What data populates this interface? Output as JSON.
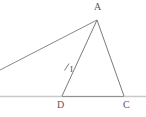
{
  "figure": {
    "background_color": "#ffffff",
    "stroke_color": "#6b6b6d",
    "baseline_color": "#c9c9c9",
    "label_color": "#59595b",
    "labels": {
      "apex": "A",
      "base_left": "D",
      "base_right": "C",
      "interior_point": "I"
    },
    "points": {
      "A": {
        "name": "A",
        "x": 97,
        "y": 20
      },
      "D": {
        "name": "D",
        "x": 62,
        "y": 96
      },
      "C": {
        "name": "C",
        "x": 124,
        "y": 96
      },
      "I": {
        "name": "I",
        "x": 68,
        "y": 67
      },
      "ray_end_left": {
        "name": "ray-end",
        "x": 0,
        "y": 70
      },
      "baseline_left": {
        "name": "baseline-start",
        "x": 0,
        "y": 96
      },
      "baseline_right": {
        "name": "baseline-end",
        "x": 146,
        "y": 96
      }
    },
    "segments": [
      {
        "name": "segment-A-D",
        "from": "A",
        "to": "D"
      },
      {
        "name": "segment-A-C",
        "from": "A",
        "to": "C"
      },
      {
        "name": "segment-D-C",
        "from": "D",
        "to": "C"
      },
      {
        "name": "ray-A-left",
        "from": "A",
        "to": "ray_end_left"
      },
      {
        "name": "baseline",
        "from": "baseline_left",
        "to": "baseline_right"
      }
    ],
    "tick_mark": {
      "name": "tick-on-AD",
      "x1": 65,
      "y1": 70,
      "x2": 69,
      "y2": 64
    }
  }
}
